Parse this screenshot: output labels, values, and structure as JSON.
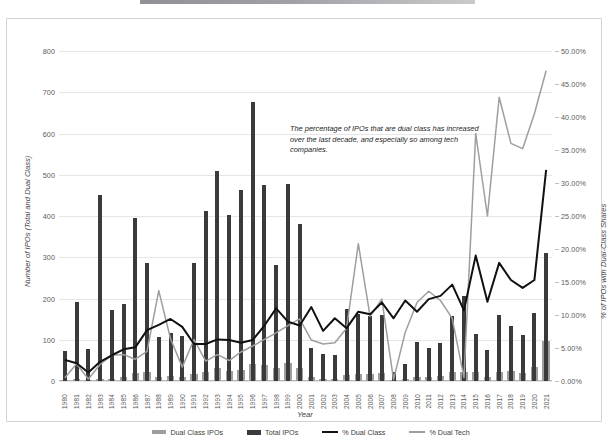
{
  "chart_data": {
    "type": "bar",
    "title": "",
    "xlabel": "Year",
    "ylabel": "Number of IPOs (Total and Dual Class)",
    "ylabel_secondary": "% of IPOs with Dual-Class Shares",
    "ylim": [
      0,
      800
    ],
    "ylim_secondary": [
      0,
      0.5
    ],
    "grid": true,
    "legend_position": "bottom",
    "annotation": "The percentage of IPOs that are dual class has increased over the last decade, and especially so among tech companies.",
    "yticks_left": [
      "0",
      "100",
      "200",
      "300",
      "400",
      "500",
      "600",
      "700",
      "800"
    ],
    "yticks_right": [
      "0.00%",
      "5.00%",
      "10.00%",
      "15.00%",
      "20.00%",
      "25.00%",
      "30.00%",
      "35.00%",
      "40.00%",
      "45.00%",
      "50.00%"
    ],
    "categories": [
      "1980",
      "1981",
      "1982",
      "1983",
      "1984",
      "1985",
      "1986",
      "1987",
      "1988",
      "1989",
      "1990",
      "1991",
      "1992",
      "1993",
      "1994",
      "1995",
      "1996",
      "1997",
      "1998",
      "1999",
      "2000",
      "2001",
      "2002",
      "2003",
      "2004",
      "2005",
      "2006",
      "2007",
      "2008",
      "2009",
      "2010",
      "2011",
      "2012",
      "2013",
      "2014",
      "2015",
      "2016",
      "2017",
      "2018",
      "2019",
      "2020",
      "2021"
    ],
    "series": [
      {
        "name": "Total IPOs",
        "type": "bar",
        "color": "#3a3a3a",
        "axis": "left",
        "values": [
          72,
          191,
          78,
          450,
          171,
          187,
          394,
          287,
          106,
          117,
          110,
          287,
          412,
          510,
          403,
          462,
          677,
          474,
          282,
          477,
          381,
          80,
          66,
          63,
          174,
          162,
          158,
          160,
          21,
          41,
          95,
          81,
          93,
          157,
          206,
          115,
          75,
          160,
          134,
          112,
          165,
          311
        ]
      },
      {
        "name": "Dual Class IPOs",
        "type": "bar",
        "color": "#9e9e9e",
        "axis": "left",
        "values": [
          3,
          5,
          1,
          6,
          6,
          9,
          20,
          22,
          9,
          11,
          9,
          16,
          23,
          32,
          25,
          27,
          42,
          40,
          31,
          43,
          32,
          9,
          5,
          6,
          14,
          17,
          16,
          19,
          2,
          5,
          10,
          10,
          12,
          23,
          22,
          22,
          9,
          23,
          24,
          20,
          34,
          97
        ]
      },
      {
        "name": "% Dual Class",
        "type": "line",
        "color": "#111111",
        "axis": "right",
        "values": [
          0.032,
          0.027,
          0.013,
          0.029,
          0.039,
          0.048,
          0.051,
          0.077,
          0.085,
          0.094,
          0.082,
          0.056,
          0.056,
          0.063,
          0.062,
          0.058,
          0.062,
          0.084,
          0.11,
          0.09,
          0.084,
          0.112,
          0.076,
          0.095,
          0.08,
          0.105,
          0.101,
          0.119,
          0.095,
          0.122,
          0.105,
          0.124,
          0.129,
          0.146,
          0.107,
          0.19,
          0.12,
          0.179,
          0.153,
          0.141,
          0.153,
          0.32
        ]
      },
      {
        "name": "% Dual Tech",
        "type": "line",
        "color": "#9e9e9e",
        "axis": "right",
        "values": [
          0.005,
          0.026,
          0.003,
          0.025,
          0.039,
          0.04,
          0.033,
          0.045,
          0.137,
          0.064,
          0.021,
          0.063,
          0.03,
          0.04,
          0.031,
          0.044,
          0.053,
          0.063,
          0.073,
          0.084,
          0.094,
          0.062,
          0.056,
          0.058,
          0.08,
          0.208,
          0.098,
          0.124,
          0.002,
          0.074,
          0.119,
          0.136,
          0.122,
          0.095,
          0.005,
          0.375,
          0.25,
          0.43,
          0.36,
          0.352,
          0.405,
          0.47
        ]
      }
    ]
  },
  "axes": {
    "x_title": "Year",
    "y_title_left": "Number of IPOs (Total and Dual Class)",
    "y_title_right": "% of IPOs with Dual-Class Shares"
  },
  "legend": {
    "items": [
      {
        "label": "Dual Class IPOs",
        "marker": "bar-swatch-gray"
      },
      {
        "label": "Total IPOs",
        "marker": "bar-swatch-dark"
      },
      {
        "label": "% Dual Class",
        "marker": "line-swatch-black"
      },
      {
        "label": "% Dual Tech",
        "marker": "line-swatch-gray"
      }
    ]
  }
}
